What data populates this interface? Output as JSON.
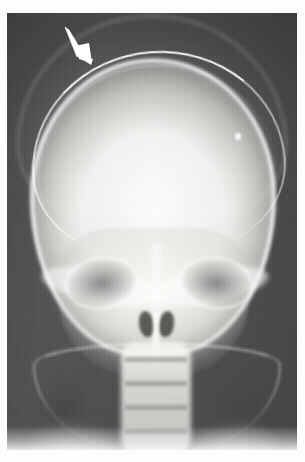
{
  "figure": {
    "kind": "radiograph",
    "modality": "plain-film-x-ray",
    "view": "anteroposterior-skull",
    "caption": "",
    "plate": {
      "left_px": 7,
      "top_px": 13,
      "width_px": 290,
      "height_px": 437,
      "background_color": "#4e4e4e",
      "border_color": "#ffffff"
    },
    "page_background_color": "#ffffff"
  },
  "annotations": [
    {
      "name": "arrow-marker",
      "shape": "solid-white-arrow",
      "color": "#ffffff",
      "direction": "down-right",
      "tail_x": 60,
      "tail_y": 17,
      "tip_x": 84,
      "tip_y": 48,
      "points_to": "scalp-soft-tissue-swelling-over-left-parietal-vault",
      "label": ""
    }
  ],
  "anatomy": [
    {
      "name": "scalp-soft-tissue-swelling",
      "label": ""
    },
    {
      "name": "cranial-vault",
      "label": ""
    },
    {
      "name": "outer-table-bone-edge",
      "label": ""
    },
    {
      "name": "left-orbit",
      "label": ""
    },
    {
      "name": "right-orbit",
      "label": ""
    },
    {
      "name": "nasal-cavity",
      "label": ""
    },
    {
      "name": "mandible",
      "label": ""
    },
    {
      "name": "cervical-spine",
      "label": ""
    },
    {
      "name": "left-shoulder",
      "label": ""
    },
    {
      "name": "right-shoulder",
      "label": ""
    }
  ],
  "colors": {
    "film_dark_field": "#4a4a4a",
    "bone_bright": "#fbfbf8",
    "soft_tissue_mid": "#bdbdb9",
    "orbit_dark": "#6c6c6a",
    "marker_white": "#ffffff",
    "margin_white": "#ffffff"
  }
}
